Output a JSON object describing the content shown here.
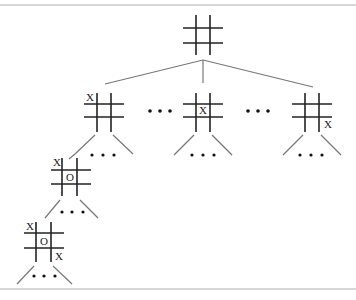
{
  "diagram": {
    "ellipsis": "• • •",
    "root": {
      "marks": []
    },
    "level1": [
      {
        "id": "left",
        "marks": [
          {
            "symbol": "X",
            "cell": "top-left"
          }
        ]
      },
      {
        "id": "middle",
        "marks": [
          {
            "symbol": "X",
            "cell": "center"
          }
        ]
      },
      {
        "id": "right",
        "marks": [
          {
            "symbol": "X",
            "cell": "bottom-right"
          }
        ]
      }
    ],
    "level2": {
      "marks": [
        {
          "symbol": "X",
          "cell": "top-left"
        },
        {
          "symbol": "O",
          "cell": "center"
        }
      ]
    },
    "level3": {
      "marks": [
        {
          "symbol": "X",
          "cell": "top-left"
        },
        {
          "symbol": "O",
          "cell": "center"
        },
        {
          "symbol": "X",
          "cell": "bottom-right"
        }
      ]
    },
    "labels": {
      "x": "X",
      "o": "O",
      "sibling_ellipsis": "• • •"
    }
  }
}
